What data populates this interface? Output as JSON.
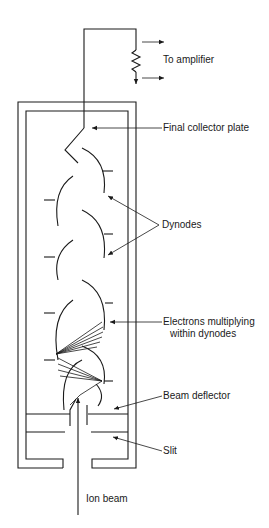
{
  "diagram": {
    "labels": {
      "to_amplifier": "To amplifier",
      "final_collector_plate": "Final collector plate",
      "dynodes": "Dynodes",
      "electrons_multiplying_line1": "Electrons multiplying",
      "electrons_multiplying_line2": "within dynodes",
      "beam_deflector": "Beam deflector",
      "slit": "Slit",
      "ion_beam": "Ion beam"
    },
    "components": [
      "resistor",
      "output-arrows",
      "housing",
      "final-collector-plate",
      "dynodes",
      "electron-paths",
      "beam-deflector",
      "slit",
      "ion-beam"
    ],
    "colors": {
      "line": "#1a1a1a",
      "background": "#ffffff"
    }
  }
}
